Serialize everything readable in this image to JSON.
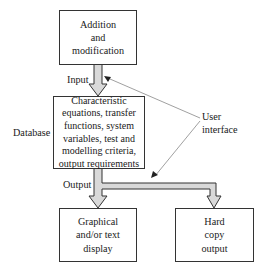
{
  "diagram": {
    "boxes": {
      "addition": "Addition\nand\nmodification",
      "database": "Characteristic\nequations, transfer\nfunctions, system\nvariables, test and\nmodelling criteria,\noutput requirements",
      "display": "Graphical\nand/or text\ndisplay",
      "hardcopy": "Hard\ncopy\noutput"
    },
    "labels": {
      "input": "Input",
      "output": "Output",
      "database": "Database",
      "user_interface": "User\ninterface"
    },
    "colors": {
      "arrow_fill": "#d9d9d9",
      "stroke": "#333333",
      "pointer": "#888888"
    }
  }
}
